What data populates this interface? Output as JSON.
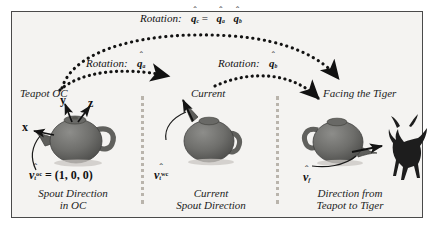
{
  "figure": {
    "background_color": "#f4f3f1",
    "frame_color": "#4a4a4a"
  },
  "annotations": {
    "rotation_composite_prefix": "Rotation:",
    "rotation_composite_expr": "q̂c = q̂a q̂b",
    "rotation_a_prefix": "Rotation:",
    "rotation_a_expr": "q̂a",
    "rotation_b_prefix": "Rotation:",
    "rotation_b_expr": "q̂b",
    "q_letter": "q",
    "hat": "ˆ",
    "sub_c": "c",
    "sub_a": "a",
    "sub_b": "b",
    "equals": "="
  },
  "panels": [
    {
      "id": "panel-left",
      "heading": "Teapot OC",
      "axes": [
        "x",
        "y",
        "z"
      ],
      "vector_symbol": "v",
      "vector_sub": "t",
      "vector_sup": "oc",
      "vector_value": "= (1, 0, 0)",
      "caption_line1": "Spout Direction",
      "caption_line2": "in OC"
    },
    {
      "id": "panel-middle",
      "heading": "Current",
      "axes": [],
      "vector_symbol": "v",
      "vector_sub": "t",
      "vector_sup": "wc",
      "vector_value": "",
      "caption_line1": "Current",
      "caption_line2": "Spout Direction"
    },
    {
      "id": "panel-right",
      "heading": "Facing the Tiger",
      "axes": [],
      "vector_symbol": "v",
      "vector_sub": "f",
      "vector_sup": "",
      "vector_value": "",
      "caption_line1": "Direction from",
      "caption_line2": "Teapot to Tiger"
    }
  ],
  "objects": {
    "teapot_label": "teapot",
    "tiger_label": "tiger",
    "teapot_body_color": "#6f6f6d",
    "teapot_shadow_color": "#4e4e4c",
    "tiger_color": "#1d1d1d"
  }
}
